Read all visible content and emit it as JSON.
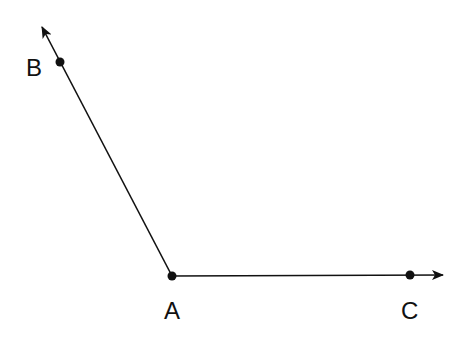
{
  "diagram": {
    "type": "angle",
    "vertex": {
      "label": "A",
      "x": 172,
      "y": 276
    },
    "rays": [
      {
        "name": "ray-AB",
        "from": "A",
        "through": "B",
        "point": {
          "label": "B",
          "x": 60,
          "y": 62
        },
        "arrow_tip": {
          "x": 42,
          "y": 27
        }
      },
      {
        "name": "ray-AC",
        "from": "A",
        "through": "C",
        "point": {
          "label": "C",
          "x": 410,
          "y": 275
        },
        "arrow_tip": {
          "x": 443,
          "y": 275
        }
      }
    ],
    "labels": {
      "A": "A",
      "B": "B",
      "C": "C"
    },
    "colors": {
      "stroke": "#111111",
      "background": "#ffffff"
    }
  }
}
